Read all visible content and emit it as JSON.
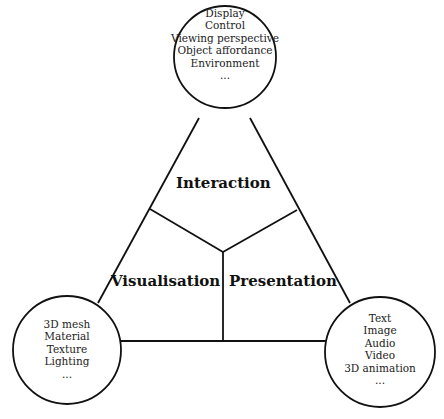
{
  "diagram": {
    "regions": {
      "interaction": "Interaction",
      "visualisation": "Visualisation",
      "presentation": "Presentation"
    },
    "nodes": {
      "top": {
        "items": [
          "Display",
          "Control",
          "Viewing perspective",
          "Object affordance",
          "Environment",
          "..."
        ]
      },
      "bottom_left": {
        "items": [
          "3D mesh",
          "Material",
          "Texture",
          "Lighting",
          "..."
        ]
      },
      "bottom_right": {
        "items": [
          "Text",
          "Image",
          "Audio",
          "Video",
          "3D animation",
          "..."
        ]
      }
    },
    "colors": {
      "line": "#111111",
      "text": "#222222"
    }
  }
}
